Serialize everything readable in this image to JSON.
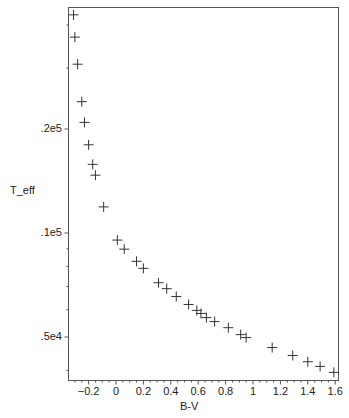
{
  "chart_data": {
    "type": "scatter",
    "title": "",
    "xlabel": "B-V",
    "ylabel": "T_eff",
    "xscale": "linear",
    "yscale": "log",
    "xlim": [
      -0.35,
      1.62
    ],
    "ylim": [
      3150,
      45000
    ],
    "grid": false,
    "legend": null,
    "marker": "+",
    "marker_color": "#333333",
    "x_ticks": [
      {
        "value": -0.2,
        "label": "-0.2"
      },
      {
        "value": 0,
        "label": "0"
      },
      {
        "value": 0.2,
        "label": "0.2"
      },
      {
        "value": 0.4,
        "label": "0.4"
      },
      {
        "value": 0.6,
        "label": "0.6"
      },
      {
        "value": 0.8,
        "label": "0.8"
      },
      {
        "value": 1.0,
        "label": "1"
      },
      {
        "value": 1.2,
        "label": "1.2"
      },
      {
        "value": 1.4,
        "label": "1.4"
      },
      {
        "value": 1.6,
        "label": "1.6"
      }
    ],
    "y_ticks": [
      {
        "value": 20000,
        "label": ".2e5"
      },
      {
        "value": 10000,
        "label": ".1e5"
      },
      {
        "value": 5000,
        "label": ".5e4"
      }
    ],
    "y_minor_ticks": [
      40000,
      30000,
      9000,
      8000,
      7000,
      6000,
      4000
    ],
    "points": [
      {
        "x": -0.31,
        "y": 42800
      },
      {
        "x": -0.3,
        "y": 36900
      },
      {
        "x": -0.28,
        "y": 30800
      },
      {
        "x": -0.25,
        "y": 24000
      },
      {
        "x": -0.23,
        "y": 20900
      },
      {
        "x": -0.2,
        "y": 18000
      },
      {
        "x": -0.17,
        "y": 15800
      },
      {
        "x": -0.15,
        "y": 14700
      },
      {
        "x": -0.09,
        "y": 11900
      },
      {
        "x": 0.01,
        "y": 9540
      },
      {
        "x": 0.06,
        "y": 8980
      },
      {
        "x": 0.15,
        "y": 8280
      },
      {
        "x": 0.2,
        "y": 7900
      },
      {
        "x": 0.31,
        "y": 7180
      },
      {
        "x": 0.37,
        "y": 6900
      },
      {
        "x": 0.44,
        "y": 6550
      },
      {
        "x": 0.53,
        "y": 6210
      },
      {
        "x": 0.59,
        "y": 5970
      },
      {
        "x": 0.62,
        "y": 5850
      },
      {
        "x": 0.66,
        "y": 5690
      },
      {
        "x": 0.72,
        "y": 5540
      },
      {
        "x": 0.82,
        "y": 5320
      },
      {
        "x": 0.91,
        "y": 5080
      },
      {
        "x": 0.95,
        "y": 4980
      },
      {
        "x": 1.14,
        "y": 4660
      },
      {
        "x": 1.29,
        "y": 4420
      },
      {
        "x": 1.4,
        "y": 4240
      },
      {
        "x": 1.49,
        "y": 4110
      },
      {
        "x": 1.59,
        "y": 3950
      }
    ]
  }
}
